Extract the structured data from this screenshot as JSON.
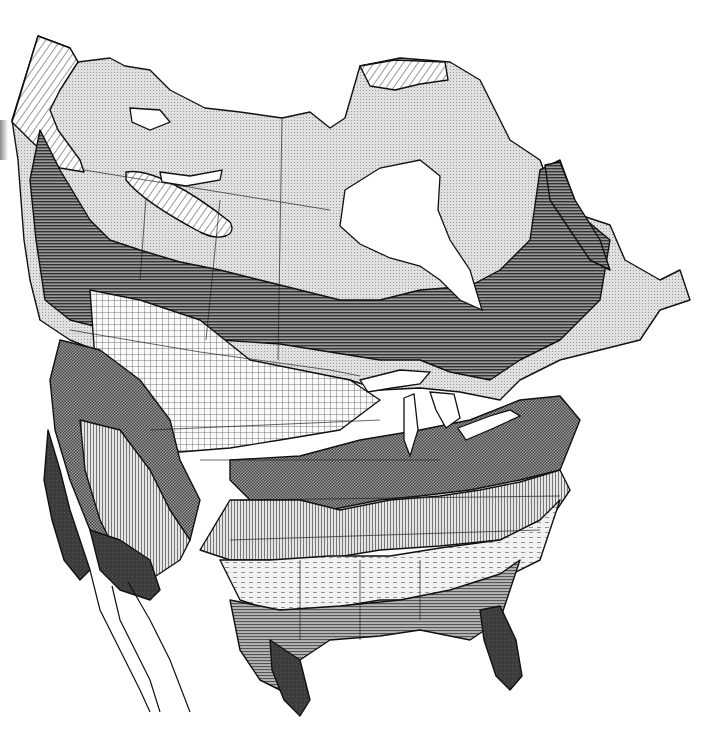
{
  "figure": {
    "kind": "map",
    "labels": [],
    "canvas": {
      "width": 716,
      "height": 754,
      "background": "#ffffff"
    }
  },
  "legend_patterns": [
    {
      "id": "tundra-dots",
      "description": "fine stipple, light gray",
      "fill": "#dcdcdc"
    },
    {
      "id": "diag-hatch",
      "description": "diagonal line hatch (alpine/ice zones)",
      "fill": "#ffffff",
      "stroke": "#333333"
    },
    {
      "id": "horiz-dark",
      "description": "dense horizontal lines, dark gray (boreal forest)",
      "fill": "#6f6f6f"
    },
    {
      "id": "grid-cross",
      "description": "square crosshatch grid, light (grassland/prairie)",
      "fill": "#f2f2f2"
    },
    {
      "id": "checker-mid",
      "description": "fine checker, mid gray (deciduous forest)",
      "fill": "#7c7c7c"
    },
    {
      "id": "vert-lines",
      "description": "vertical lines, light-mid gray",
      "fill": "#bdbdbd"
    },
    {
      "id": "dash-light",
      "description": "short dashes, very light (southern mixed)",
      "fill": "#e8e8e8"
    },
    {
      "id": "horiz-mid",
      "description": "horizontal lines mid gray (southeast pine)",
      "fill": "#8c8c8c"
    },
    {
      "id": "solid-dark",
      "description": "near-black solid (subtropical / chaparral)",
      "fill": "#3a3a3a"
    }
  ],
  "regions": [
    {
      "name": "arctic-tundra",
      "pattern": "tundra-dots"
    },
    {
      "name": "alaska-alpine",
      "pattern": "diag-hatch"
    },
    {
      "name": "arctic-islands-ice",
      "pattern": "diag-hatch"
    },
    {
      "name": "boreal-forest",
      "pattern": "horiz-dark"
    },
    {
      "name": "great-plains",
      "pattern": "grid-cross"
    },
    {
      "name": "eastern-deciduous",
      "pattern": "checker-mid"
    },
    {
      "name": "central-vertical",
      "pattern": "vert-lines"
    },
    {
      "name": "southern-dashes",
      "pattern": "dash-light"
    },
    {
      "name": "southeast-pine",
      "pattern": "horiz-mid"
    },
    {
      "name": "california-chaparral",
      "pattern": "solid-dark"
    },
    {
      "name": "sonoran-desert",
      "pattern": "solid-dark"
    },
    {
      "name": "texas-gulf-coast",
      "pattern": "solid-dark"
    },
    {
      "name": "florida",
      "pattern": "solid-dark"
    },
    {
      "name": "hudson-bay",
      "pattern": "water"
    },
    {
      "name": "great-lakes",
      "pattern": "water"
    },
    {
      "name": "baja-california",
      "pattern": "outline-only"
    }
  ]
}
